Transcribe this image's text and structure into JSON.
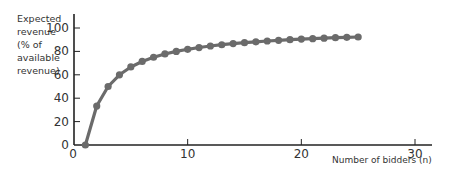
{
  "chart_data": {
    "type": "line",
    "title": "",
    "xlabel": "Number of bidders (n)",
    "ylabel": "Expected revenue (% of available revenue)",
    "ylabel_lines": [
      "Expected",
      "revenue",
      "(% of",
      "available",
      "revenue)"
    ],
    "xlim": [
      0,
      32
    ],
    "ylim": [
      0,
      110
    ],
    "xticks": [
      0,
      10,
      20,
      30
    ],
    "yticks": [
      0,
      20,
      40,
      60,
      80,
      100
    ],
    "grid": false,
    "legend": null,
    "series": [
      {
        "name": "Expected revenue",
        "color": "#6b6b6b",
        "x": [
          1,
          2,
          3,
          4,
          5,
          6,
          7,
          8,
          9,
          10,
          11,
          12,
          13,
          14,
          15,
          16,
          17,
          18,
          19,
          20,
          21,
          22,
          23,
          24,
          25
        ],
        "y": [
          0,
          33.3,
          50,
          60,
          66.7,
          71.4,
          75,
          77.8,
          80,
          81.8,
          83.3,
          84.6,
          85.7,
          86.7,
          87.5,
          88.2,
          88.9,
          89.5,
          90,
          90.5,
          90.9,
          91.3,
          91.7,
          92,
          92.3
        ]
      }
    ]
  }
}
